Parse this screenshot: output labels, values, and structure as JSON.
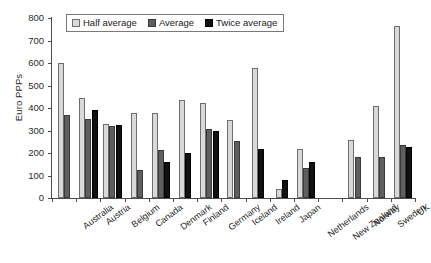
{
  "chart_data": {
    "type": "bar",
    "title": "",
    "subtitle": "",
    "xlabel": "",
    "ylabel": "Euro PPPs",
    "ylim": [
      0,
      800
    ],
    "ytick_step": 100,
    "yticks": [
      0,
      100,
      200,
      300,
      400,
      500,
      600,
      700,
      800
    ],
    "ytick_labels": [
      "0",
      "100",
      "200",
      "300",
      "400",
      "500",
      "600",
      "700",
      "800"
    ],
    "grid": false,
    "legend_position": "top-left-inside",
    "categories": [
      "Australia",
      "Austria",
      "Belgium",
      "Canada",
      "Denmark",
      "Finland",
      "Germany",
      "Iceland",
      "Ireland",
      "Japan",
      "Netherlands",
      "New Zealand",
      "Norway",
      "Sweden",
      "UK"
    ],
    "series": [
      {
        "name": "Half average",
        "color": "#d9d9d6",
        "values": [
          600,
          445,
          327,
          378,
          378,
          435,
          422,
          345,
          578,
          38,
          218,
          null,
          260,
          410,
          763
        ]
      },
      {
        "name": "Average",
        "color": "#5f5f5f",
        "values": [
          370,
          352,
          318,
          123,
          215,
          null,
          308,
          253,
          null,
          null,
          133,
          null,
          182,
          182,
          235
        ]
      },
      {
        "name": "Twice average",
        "color": "#111111",
        "values": [
          null,
          392,
          325,
          null,
          162,
          200,
          300,
          null,
          218,
          82,
          160,
          null,
          null,
          null,
          225
        ]
      }
    ]
  },
  "legend": {
    "items": [
      {
        "label": "Half average",
        "swatch": "legend-swatch-half"
      },
      {
        "label": "Average",
        "swatch": "legend-swatch-avg"
      },
      {
        "label": "Twice average",
        "swatch": "legend-swatch-twice"
      }
    ]
  }
}
